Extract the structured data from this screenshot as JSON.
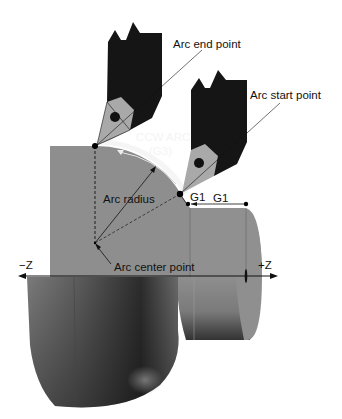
{
  "diagram": {
    "colors": {
      "background": "#ffffff",
      "workpiece_face": "#8e8e8e",
      "workpiece_shadow_dark": "#2e2e2e",
      "tool_holder": "#151515",
      "tool_insert": "#a9a9a9",
      "arc_clearance": "#f2f2f2",
      "line": "#111111"
    },
    "labels": {
      "arc_end_point": "Arc end point",
      "arc_start_point": "Arc start point",
      "ccw_arc_line1": "CCW ARC",
      "ccw_arc_line2": "(G3)",
      "arc_radius": "Arc radius",
      "arc_center_point": "Arc center point",
      "g1_short": "G1",
      "g1_long": "G1",
      "axis_neg_z": "−Z",
      "axis_pos_z": "+Z"
    },
    "points": {
      "arc_end": {
        "x": 95,
        "y": 146
      },
      "arc_start": {
        "x": 180,
        "y": 194
      },
      "arc_center": {
        "x": 95,
        "y": 243
      },
      "g1_mid": {
        "x": 188,
        "y": 204
      },
      "g1_right": {
        "x": 246,
        "y": 204
      }
    },
    "axis": {
      "y": 276,
      "x_start": 18,
      "x_end": 278
    }
  }
}
